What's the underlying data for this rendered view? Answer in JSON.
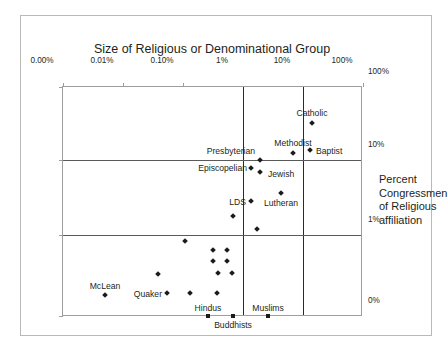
{
  "figure": {
    "title": "Size of Religious or Denominational Group",
    "y_axis_caption_lines": [
      "Percent",
      "Congressmen",
      "of Religious",
      "affiliation"
    ]
  },
  "chart_data": {
    "type": "scatter",
    "title": "Size of Religious or Denominational Group",
    "xlabel": "Size of Religious or Denominational Group",
    "ylabel": "Percent Congressmen of Religious affiliation",
    "x_scale": "log",
    "y_scale": "log",
    "grid": true,
    "legend": "none",
    "x_tick_labels": [
      "0.00%",
      "0.01%",
      "0.10%",
      "1%",
      "10%",
      "100%"
    ],
    "x_tick_positions_px": [
      41,
      101,
      161,
      221,
      281,
      341
    ],
    "y_tick_labels": [
      "100%",
      "10%",
      "1%",
      "0%"
    ],
    "y_tick_positions_px": [
      70,
      143,
      218,
      299
    ],
    "gridlines_vertical_at": [
      "1%",
      "10%"
    ],
    "gridlines_horizontal_at": [
      "10%",
      "1%"
    ],
    "points": [
      {
        "label": "Catholic",
        "marker": "diamond",
        "x_px": 290,
        "y_px": 106,
        "label_x_px": 290,
        "label_y_px": 91,
        "label_anchor": "middle",
        "x_value": "~25%",
        "y_value": "~30%"
      },
      {
        "label": "Baptist",
        "marker": "diamond",
        "x_px": 288,
        "y_px": 133,
        "label_x_px": 294,
        "label_y_px": 129,
        "label_anchor": "start",
        "x_value": "~22%",
        "y_value": "~14%"
      },
      {
        "label": "Methodist",
        "parenthetical": "",
        "marker": "diamond",
        "x_px": 271,
        "y_px": 136,
        "label_x_px": 271,
        "label_y_px": 121,
        "label_anchor": "middle",
        "x_value": "~8%",
        "y_value": "~12%"
      },
      {
        "label": "Presbyterian",
        "marker": "diamond",
        "x_px": 238,
        "y_px": 143,
        "label_x_px": 233,
        "label_y_px": 129,
        "label_anchor": "end",
        "x_value": "~2.5%",
        "y_value": "~10%"
      },
      {
        "label": "Episcopelian",
        "marker": "diamond",
        "x_px": 229,
        "y_px": 151,
        "label_x_px": 225,
        "label_y_px": 146,
        "label_anchor": "end",
        "x_value": "~1.8%",
        "y_value": "~8%"
      },
      {
        "label": "Jewish",
        "marker": "diamond",
        "x_px": 238,
        "y_px": 155,
        "label_x_px": 246,
        "label_y_px": 152,
        "label_anchor": "start",
        "x_value": "~2.5%",
        "y_value": "~7%"
      },
      {
        "label": "Lutheran",
        "marker": "diamond",
        "x_px": 259,
        "y_px": 176,
        "label_x_px": 259,
        "label_y_px": 181,
        "label_anchor": "middle",
        "x_value": "~5%",
        "y_value": "~4%"
      },
      {
        "label": "LDS",
        "marker": "diamond",
        "x_px": 229,
        "y_px": 184,
        "label_x_px": 224,
        "label_y_px": 180,
        "label_anchor": "end",
        "x_value": "~1.8%",
        "y_value": "~3%"
      },
      {
        "label": "",
        "marker": "diamond",
        "x_px": 211,
        "y_px": 199,
        "x_value": "~0.7%",
        "y_value": "~2%"
      },
      {
        "label": "",
        "marker": "diamond",
        "x_px": 235,
        "y_px": 212,
        "x_value": "~2.2%",
        "y_value": "~1.3%"
      },
      {
        "label": "",
        "marker": "diamond",
        "x_px": 163,
        "y_px": 224,
        "x_value": "~0.11%",
        "y_value": "~0.9%"
      },
      {
        "label": "",
        "marker": "diamond",
        "x_px": 191,
        "y_px": 233,
        "x_value": "~0.35%",
        "y_value": "~0.8%"
      },
      {
        "label": "",
        "marker": "diamond",
        "x_px": 205,
        "y_px": 233,
        "x_value": "~0.55%",
        "y_value": "~0.8%"
      },
      {
        "label": "",
        "marker": "diamond",
        "x_px": 191,
        "y_px": 244,
        "x_value": "~0.35%",
        "y_value": "~0.65%"
      },
      {
        "label": "",
        "marker": "diamond",
        "x_px": 205,
        "y_px": 244,
        "x_value": "~0.55%",
        "y_value": "~0.65%"
      },
      {
        "label": "",
        "marker": "diamond",
        "x_px": 196,
        "y_px": 256,
        "x_value": "~0.4%",
        "y_value": "~0.5%"
      },
      {
        "label": "",
        "marker": "diamond",
        "x_px": 210,
        "y_px": 256,
        "x_value": "~0.65%",
        "y_value": "~0.5%"
      },
      {
        "label": "",
        "marker": "diamond",
        "x_px": 136,
        "y_px": 257,
        "x_value": "~0.04%",
        "y_value": "~0.5%"
      },
      {
        "label": "McLean",
        "marker": "diamond",
        "x_px": 83,
        "y_px": 278,
        "label_x_px": 83,
        "label_y_px": 264,
        "label_anchor": "middle",
        "x_value": "~0.006%",
        "y_value": "~0.25%"
      },
      {
        "label": "Quaker",
        "marker": "diamond",
        "x_px": 145,
        "y_px": 276,
        "label_x_px": 140,
        "label_y_px": 272,
        "label_anchor": "end",
        "x_value": "~0.06%",
        "y_value": "~0.25%"
      },
      {
        "label": "",
        "marker": "diamond",
        "x_px": 168,
        "y_px": 276,
        "x_value": "~0.13%",
        "y_value": "~0.25%"
      },
      {
        "label": "",
        "marker": "diamond",
        "x_px": 195,
        "y_px": 276,
        "x_value": "~0.4%",
        "y_value": "~0.25%"
      },
      {
        "label": "Hindus",
        "marker": "square",
        "x_px": 186,
        "y_px": 299,
        "label_x_px": 186,
        "label_y_px": 286,
        "label_anchor": "middle",
        "x_value": "~0.3%",
        "y_value": "0%"
      },
      {
        "label": "Buddhists",
        "marker": "square",
        "x_px": 211,
        "y_px": 299,
        "label_x_px": 211,
        "label_y_px": 303,
        "label_anchor": "middle",
        "x_value": "~0.7%",
        "y_value": "0%"
      },
      {
        "label": "Muslims",
        "marker": "square",
        "x_px": 246,
        "y_px": 299,
        "label_x_px": 246,
        "label_y_px": 286,
        "label_anchor": "middle",
        "x_value": "~3%",
        "y_value": "0%"
      }
    ]
  }
}
